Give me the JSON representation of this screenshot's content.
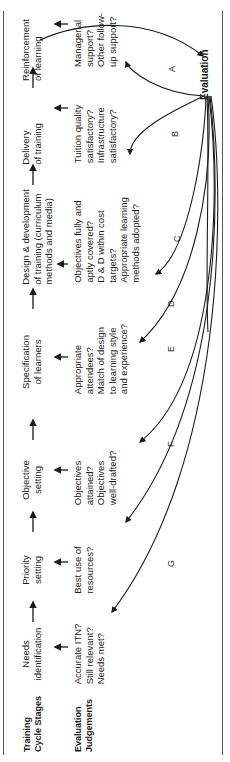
{
  "row_labels": {
    "stages": [
      "Training",
      "Cycle Stages"
    ],
    "judgements": [
      "Evaluation",
      "Judgements"
    ]
  },
  "evaluation_label": "Evaluation",
  "stages": [
    {
      "id": "needs",
      "lines": [
        "Needs",
        "identification"
      ],
      "judgement": [
        "Accurate ITN?",
        "Still relevant?",
        "Needs met?"
      ],
      "curve": "G"
    },
    {
      "id": "priority",
      "lines": [
        "Priority",
        "setting"
      ],
      "judgement": [
        "Best use of",
        "resources?"
      ],
      "curve": ""
    },
    {
      "id": "objective",
      "lines": [
        "Objective",
        "setting"
      ],
      "judgement": [
        "Objectives",
        "attained?",
        "Objectives",
        "well-drafted?"
      ],
      "curve": "F"
    },
    {
      "id": "specification",
      "lines": [
        "Specification",
        "of learners"
      ],
      "judgement": [
        "Appropriate",
        "attendees?",
        "Match of design",
        "to learning style",
        "and experience?"
      ],
      "curve": "E"
    },
    {
      "id": "design",
      "lines": [
        "Design & development",
        "of training (curriculum",
        "methods and media)"
      ],
      "judgement": [
        "Objectives fully and",
        "aptly covered?",
        "D & D within cost",
        "targets?",
        "Appropriate learning",
        "methods adopted?"
      ],
      "curve": "D / C"
    },
    {
      "id": "delivery",
      "lines": [
        "Delivery",
        "of training"
      ],
      "judgement": [
        "Tuition quality",
        "satisfactory?",
        "Infrastructure",
        "satisfactory?"
      ],
      "curve": "B"
    },
    {
      "id": "reinforcement",
      "lines": [
        "Reinforcement",
        "of learning"
      ],
      "judgement": [
        "Managerial",
        "support?",
        "Other follow-",
        "up support?"
      ],
      "curve": "A"
    }
  ],
  "curve_labels": [
    "A",
    "B",
    "C",
    "D",
    "E",
    "F",
    "G"
  ],
  "colors": {
    "line": "#1a1a1a",
    "frame": "#555555",
    "background": "#ffffff"
  }
}
